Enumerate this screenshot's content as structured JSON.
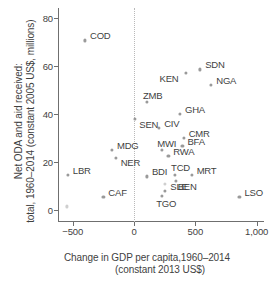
{
  "chart_data": {
    "type": "scatter",
    "title": "",
    "xlabel": "Change in GDP per capita,1960–2014 (constant 2013 US$)",
    "xlabel_line1": "Change in GDP per capita,1960–2014",
    "xlabel_line2": "(constant 2013 US$)",
    "ylabel": "Net ODA and aid received: total, 1960–2014 (constant 2005 US$, millions)",
    "ylabel_line1": "Net ODA and aid received:",
    "ylabel_line2": "total, 1960–2014 (constant 2005 US$, millions)",
    "xlim": [
      -620,
      1060
    ],
    "ylim": [
      -5,
      84
    ],
    "xticks": [
      -500,
      0,
      500,
      1000
    ],
    "xticklabels": [
      "−500",
      "0",
      "500",
      "1,000"
    ],
    "yticks": [
      0,
      20,
      40,
      60,
      80
    ],
    "yticklabels": [
      "0",
      "20",
      "40",
      "60",
      "80"
    ],
    "grid": false,
    "legend": null,
    "reference_lines": [
      {
        "axis": "x",
        "value": 0,
        "style": "dotted",
        "color": "#b9b9b9"
      }
    ],
    "point_color": "#9a9a9a",
    "points": [
      {
        "label": "COD",
        "x": -400,
        "y": 70.5,
        "label_dx": 5,
        "label_dy": -4
      },
      {
        "label": "SDN",
        "x": 540,
        "y": 58.5,
        "label_dx": 5,
        "label_dy": -4
      },
      {
        "label": "KEN",
        "x": 420,
        "y": 57.0,
        "label_dx": -26,
        "label_dy": 6
      },
      {
        "label": "NGA",
        "x": 630,
        "y": 52.0,
        "label_dx": 5,
        "label_dy": -4
      },
      {
        "label": "ZMB",
        "x": 105,
        "y": 45.0,
        "label_dx": -4,
        "label_dy": -6
      },
      {
        "label": "GHA",
        "x": 375,
        "y": 40.0,
        "label_dx": 5,
        "label_dy": -4
      },
      {
        "label": "SEN",
        "x": 10,
        "y": 38.0,
        "label_dx": 4,
        "label_dy": 6
      },
      {
        "label": "CIV",
        "x": 205,
        "y": 34.0,
        "label_dx": 5,
        "label_dy": -4
      },
      {
        "label": "CMR",
        "x": 405,
        "y": 30.0,
        "label_dx": 5,
        "label_dy": -4
      },
      {
        "label": "BFA",
        "x": 395,
        "y": 26.5,
        "label_dx": 5,
        "label_dy": -4
      },
      {
        "label": "MWI",
        "x": 230,
        "y": 25.0,
        "label_dx": -5,
        "label_dy": -6
      },
      {
        "label": "MDG",
        "x": -180,
        "y": 25.0,
        "label_dx": 5,
        "label_dy": -4
      },
      {
        "label": "RWA",
        "x": 280,
        "y": 22.5,
        "label_dx": 5,
        "label_dy": -4
      },
      {
        "label": "NER",
        "x": -150,
        "y": 21.5,
        "label_dx": 5,
        "label_dy": 5
      },
      {
        "label": "TCD",
        "x": 335,
        "y": 14.5,
        "label_dx": -4,
        "label_dy": -7
      },
      {
        "label": "MRT",
        "x": 470,
        "y": 14.5,
        "label_dx": 5,
        "label_dy": -4
      },
      {
        "label": "BDI",
        "x": 105,
        "y": 14.0,
        "label_dx": 5,
        "label_dy": -4
      },
      {
        "label": "BEN",
        "x": 340,
        "y": 12.0,
        "label_dx": 2,
        "label_dy": 6
      },
      {
        "label": "SLE",
        "x": 255,
        "y": 8.0,
        "label_dx": 5,
        "label_dy": -4
      },
      {
        "label": "TGO",
        "x": 230,
        "y": 6.0,
        "label_dx": -6,
        "label_dy": 8
      },
      {
        "label": "CAF",
        "x": -250,
        "y": 5.5,
        "label_dx": 5,
        "label_dy": -4
      },
      {
        "label": "LBR",
        "x": -540,
        "y": 14.5,
        "label_dx": 5,
        "label_dy": -4
      },
      {
        "label": "LSO",
        "x": 860,
        "y": 5.5,
        "label_dx": 5,
        "label_dy": -4
      }
    ],
    "unlabeled_points": [
      {
        "x": 380,
        "y": 9.5,
        "faint": true
      },
      {
        "x": -550,
        "y": 1.5,
        "faint": true
      },
      {
        "x": 255,
        "y": 11.0,
        "faint": true
      }
    ]
  }
}
